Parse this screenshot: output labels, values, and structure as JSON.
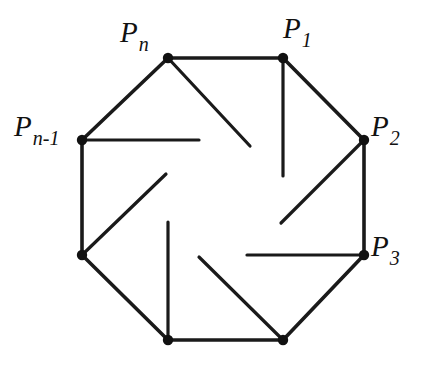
{
  "figure": {
    "background_color": "#ffffff",
    "stroke_color": "#1a1a1a",
    "vertex_dot_color": "#111111",
    "edge_stroke_width": 3.6,
    "spoke_stroke_width": 3.2,
    "vertex_dot_radius": 5.2
  },
  "geometry": {
    "type": "regular-octagon",
    "vertex_count": 8,
    "center": {
      "x": 223,
      "y": 198
    },
    "vertices": [
      {
        "id": "v-top-left",
        "x": 168,
        "y": 58,
        "label_key": "p_n"
      },
      {
        "id": "v-top-right",
        "x": 283,
        "y": 58,
        "label_key": "p_1"
      },
      {
        "id": "v-right-top",
        "x": 364,
        "y": 140,
        "label_key": "p_2"
      },
      {
        "id": "v-right-bottom",
        "x": 364,
        "y": 255,
        "label_key": "p_3"
      },
      {
        "id": "v-bottom-right",
        "x": 283,
        "y": 340,
        "label_key": null
      },
      {
        "id": "v-bottom-left",
        "x": 168,
        "y": 340,
        "label_key": null
      },
      {
        "id": "v-left-bottom",
        "x": 82,
        "y": 255,
        "label_key": null
      },
      {
        "id": "v-left-top",
        "x": 82,
        "y": 140,
        "label_key": "p_n_minus_1"
      }
    ],
    "edges": [
      {
        "id": "edge-top",
        "x1": 168,
        "y1": 58,
        "x2": 283,
        "y2": 58
      },
      {
        "id": "edge-upper-right",
        "x1": 283,
        "y1": 58,
        "x2": 364,
        "y2": 140
      },
      {
        "id": "edge-right",
        "x1": 364,
        "y1": 140,
        "x2": 364,
        "y2": 255
      },
      {
        "id": "edge-lower-right",
        "x1": 364,
        "y1": 255,
        "x2": 283,
        "y2": 340
      },
      {
        "id": "edge-bottom",
        "x1": 283,
        "y1": 340,
        "x2": 168,
        "y2": 340
      },
      {
        "id": "edge-lower-left",
        "x1": 168,
        "y1": 340,
        "x2": 82,
        "y2": 255
      },
      {
        "id": "edge-left",
        "x1": 82,
        "y1": 255,
        "x2": 82,
        "y2": 140
      },
      {
        "id": "edge-upper-left",
        "x1": 82,
        "y1": 140,
        "x2": 168,
        "y2": 58
      }
    ],
    "spokes": [
      {
        "id": "spoke-from-pn",
        "from": "v-top-left",
        "x1": 168,
        "y1": 58,
        "x2": 250,
        "y2": 146
      },
      {
        "id": "spoke-from-p1",
        "from": "v-top-right",
        "x1": 283,
        "y1": 58,
        "x2": 283,
        "y2": 176
      },
      {
        "id": "spoke-from-p2",
        "from": "v-right-top",
        "x1": 364,
        "y1": 140,
        "x2": 281,
        "y2": 223
      },
      {
        "id": "spoke-from-p3",
        "from": "v-right-bottom",
        "x1": 364,
        "y1": 255,
        "x2": 247,
        "y2": 255
      },
      {
        "id": "spoke-from-bottom-right",
        "from": "v-bottom-right",
        "x1": 283,
        "y1": 340,
        "x2": 199,
        "y2": 257
      },
      {
        "id": "spoke-from-bottom-left",
        "from": "v-bottom-left",
        "x1": 168,
        "y1": 340,
        "x2": 168,
        "y2": 222
      },
      {
        "id": "spoke-from-left-bottom",
        "from": "v-left-bottom",
        "x1": 82,
        "y1": 255,
        "x2": 166,
        "y2": 174
      },
      {
        "id": "spoke-from-pn-1",
        "from": "v-left-top",
        "x1": 82,
        "y1": 140,
        "x2": 199,
        "y2": 140
      }
    ]
  },
  "labels": {
    "p_n": {
      "base": "P",
      "sub": "n",
      "x": 120,
      "y": 18,
      "anchor": "above-left-of-vertex"
    },
    "p_1": {
      "base": "P",
      "sub": "1",
      "x": 283,
      "y": 14,
      "anchor": "above-right-of-vertex"
    },
    "p_2": {
      "base": "P",
      "sub": "2",
      "x": 371,
      "y": 112,
      "anchor": "right-of-vertex"
    },
    "p_3": {
      "base": "P",
      "sub": "3",
      "x": 371,
      "y": 232,
      "anchor": "right-of-vertex"
    },
    "p_n_minus_1": {
      "base": "P",
      "sub": "n-1",
      "x": 14,
      "y": 112,
      "anchor": "left-of-vertex"
    }
  }
}
